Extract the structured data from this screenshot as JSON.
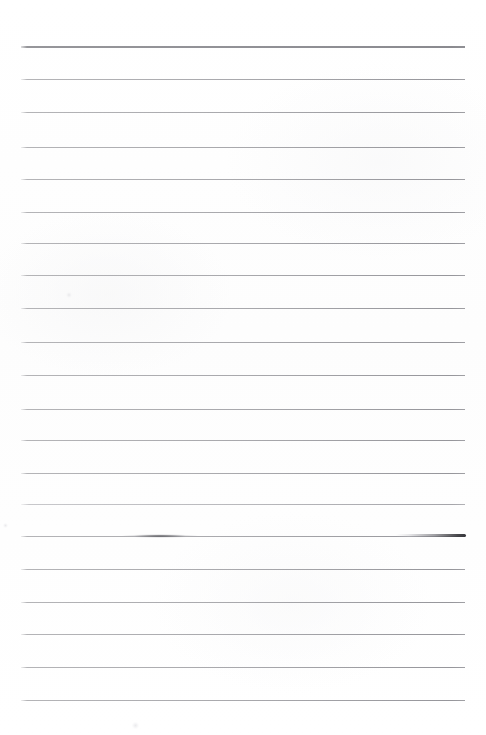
{
  "document": {
    "kind": "scanned-ruled-notebook-page",
    "title": "Blank Ruled Page",
    "page_width": 486,
    "page_height": 735,
    "background_color": "#fefefe",
    "has_text": false,
    "text_content": "",
    "visible_text": []
  },
  "paper": {
    "margin_left": 21,
    "margin_right": 21,
    "rule_start_x": 21,
    "rule_end_x": 465,
    "rule_width": 444,
    "rule_color": "#a8a8ac",
    "header_rule_color": "#919196",
    "rule_spacing_px": 33,
    "rule_count": 20
  },
  "rules": [
    {
      "id": "header-rule",
      "y": 46,
      "style": "header",
      "thickness": 2
    },
    {
      "id": "rule-01",
      "y": 79,
      "style": "normal",
      "thickness": 1
    },
    {
      "id": "rule-02",
      "y": 112,
      "style": "normal",
      "thickness": 1
    },
    {
      "id": "rule-03",
      "y": 147,
      "style": "normal",
      "thickness": 1
    },
    {
      "id": "rule-04",
      "y": 179,
      "style": "normal",
      "thickness": 1
    },
    {
      "id": "rule-05",
      "y": 212,
      "style": "normal",
      "thickness": 1
    },
    {
      "id": "rule-06",
      "y": 243,
      "style": "normal",
      "thickness": 1
    },
    {
      "id": "rule-07",
      "y": 275,
      "style": "normal",
      "thickness": 1
    },
    {
      "id": "rule-08",
      "y": 308,
      "style": "normal",
      "thickness": 1
    },
    {
      "id": "rule-09",
      "y": 342,
      "style": "normal",
      "thickness": 1
    },
    {
      "id": "rule-10",
      "y": 375,
      "style": "normal",
      "thickness": 1
    },
    {
      "id": "rule-11",
      "y": 409,
      "style": "normal",
      "thickness": 1
    },
    {
      "id": "rule-12",
      "y": 440,
      "style": "normal",
      "thickness": 1
    },
    {
      "id": "rule-13",
      "y": 473,
      "style": "normal",
      "thickness": 1
    },
    {
      "id": "rule-14",
      "y": 504,
      "style": "faint",
      "thickness": 1
    },
    {
      "id": "rule-15",
      "y": 536,
      "style": "normal",
      "thickness": 1
    },
    {
      "id": "rule-16",
      "y": 569,
      "style": "normal",
      "thickness": 1
    },
    {
      "id": "rule-17",
      "y": 602,
      "style": "normal",
      "thickness": 1
    },
    {
      "id": "rule-18",
      "y": 634,
      "style": "normal",
      "thickness": 1
    },
    {
      "id": "rule-19",
      "y": 667,
      "style": "normal",
      "thickness": 1
    },
    {
      "id": "rule-20",
      "y": 700,
      "style": "normal",
      "thickness": 1
    }
  ],
  "artifacts": {
    "smudges": [
      {
        "id": "smudge-left",
        "shape": "lens",
        "x": 120,
        "y": 534,
        "width": 80,
        "height": 4,
        "color": "#46464a"
      },
      {
        "id": "smudge-right",
        "shape": "taper",
        "x": 396,
        "y": 534,
        "width": 70,
        "height": 3,
        "color": "#37373c"
      }
    ],
    "specks": [
      {
        "id": "speck-upper-left",
        "x": 66,
        "y": 292,
        "size": 6,
        "color": "#e4e4e7"
      },
      {
        "id": "speck-lower-mid",
        "x": 132,
        "y": 722,
        "size": 7,
        "color": "#f0f0f2"
      },
      {
        "id": "speck-left-edge",
        "x": 3,
        "y": 523,
        "size": 5,
        "color": "#ededf0"
      }
    ]
  }
}
